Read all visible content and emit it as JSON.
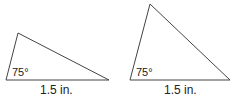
{
  "triangles": [
    {
      "angle_label": "75°",
      "base_label": "1.5 in.",
      "points": {
        "bottom_left": [
          6,
          80
        ],
        "apex": [
          18,
          33
        ],
        "bottom_right": [
          109,
          80
        ]
      }
    },
    {
      "angle_label": "75°",
      "base_label": "1.5 in.",
      "points": {
        "bottom_left": [
          130,
          80
        ],
        "apex": [
          150,
          4
        ],
        "bottom_right": [
          230,
          80
        ]
      }
    }
  ],
  "colors": {
    "stroke": "#444444",
    "text": "#222222"
  }
}
